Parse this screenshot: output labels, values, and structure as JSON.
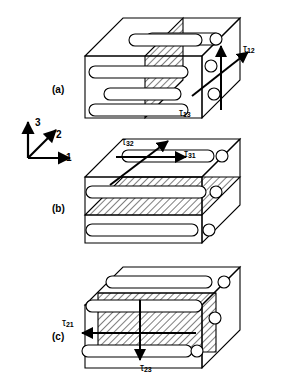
{
  "figure": {
    "type": "technical-line-diagram",
    "background_color": "#ffffff",
    "line_color": "#000000",
    "hatch_color": "#000000"
  },
  "axes_triad": {
    "name": "coordinate-triad",
    "origin_description": "lower-left of triad",
    "axis_1": {
      "label": "1",
      "direction": "right",
      "icon": "arrow-right-icon"
    },
    "axis_2": {
      "label": "2",
      "direction": "diagonal-up-right",
      "icon": "arrow-diagonal-icon"
    },
    "axis_3": {
      "label": "3",
      "direction": "up",
      "icon": "arrow-up-icon"
    }
  },
  "panels": [
    {
      "id": "a",
      "label": "(a)",
      "plane_description": "vertical hatched plane normal to axis 1 cutting through block",
      "hatch_plane": "2-3 plane",
      "fiber_direction": "axis 1",
      "stresses": [
        {
          "symbol": "τ",
          "sub": "12",
          "label": "τ12",
          "direction": "diagonal-up-right",
          "icon": "arrow-diagonal-icon"
        },
        {
          "symbol": "τ",
          "sub": "13",
          "label": "τ13",
          "direction": "up",
          "icon": "arrow-up-icon"
        }
      ]
    },
    {
      "id": "b",
      "label": "(b)",
      "plane_description": "horizontal hatched plane normal to axis 3",
      "hatch_plane": "1-2 plane",
      "fiber_direction": "axis 1",
      "stresses": [
        {
          "symbol": "τ",
          "sub": "32",
          "label": "τ32",
          "direction": "diagonal-up-right",
          "icon": "arrow-diagonal-icon"
        },
        {
          "symbol": "τ",
          "sub": "31",
          "label": "τ31",
          "direction": "right",
          "icon": "arrow-right-icon"
        }
      ]
    },
    {
      "id": "c",
      "label": "(c)",
      "plane_description": "vertical hatched front face normal to axis 2",
      "hatch_plane": "1-3 plane",
      "fiber_direction": "axis 1",
      "stresses": [
        {
          "symbol": "τ",
          "sub": "21",
          "label": "τ21",
          "direction": "left",
          "icon": "arrow-left-icon"
        },
        {
          "symbol": "τ",
          "sub": "23",
          "label": "τ23",
          "direction": "down",
          "icon": "arrow-down-icon"
        }
      ]
    }
  ]
}
